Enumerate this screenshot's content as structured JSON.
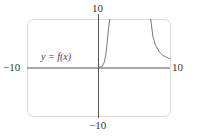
{
  "chart_data": {
    "type": "line",
    "title": "",
    "xlabel": "",
    "ylabel": "",
    "xlim": [
      -10,
      10
    ],
    "ylim": [
      -10,
      10
    ],
    "grid": false,
    "tick_labels": {
      "x_min": "−10",
      "x_max": "10",
      "y_min": "−10",
      "y_max": "10"
    },
    "annotations": [
      {
        "text": "y = f(x)",
        "x": -7.5,
        "y": 1.5
      }
    ],
    "series": [
      {
        "name": "y = f(x)",
        "segments": [
          {
            "x": [
              0,
              0.5,
              0.8,
              1.0,
              1.2,
              1.4,
              1.6
            ],
            "y": [
              0,
              0.2,
              1.0,
              2.5,
              5.0,
              8.0,
              10
            ]
          },
          {
            "x": [
              7.3,
              7.6,
              8.0,
              8.5,
              9.0,
              9.5,
              10
            ],
            "y": [
              10,
              6.5,
              4.5,
              3.2,
              2.5,
              2.1,
              1.8
            ]
          }
        ]
      }
    ],
    "colors": {
      "axis": "#555555",
      "curve": "#7a7a7a",
      "frame": "#d9d9d9"
    }
  },
  "labels": {
    "y_max": "10",
    "y_min": "−10",
    "x_min": "−10",
    "x_max": "10",
    "function": "y = f(x)"
  }
}
